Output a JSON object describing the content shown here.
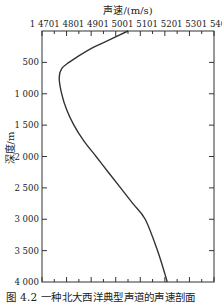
{
  "chart_data": {
    "type": "line",
    "title": "",
    "xlabel": "声速/(m/s)",
    "ylabel": "深度/m",
    "xlim": [
      1470,
      1540
    ],
    "ylim": [
      0,
      4000
    ],
    "y_inverted": true,
    "x_axis_position": "top",
    "x_ticks": [
      1470,
      1480,
      1490,
      1500,
      1510,
      1520,
      1530,
      1540
    ],
    "x_tick_labels": [
      "1 470",
      "1 480",
      "1 490",
      "1 500",
      "1 510",
      "1 520",
      "1 530",
      "1 540"
    ],
    "y_ticks": [
      500,
      1000,
      1500,
      2000,
      2500,
      3000,
      3500,
      4000
    ],
    "y_tick_labels": [
      "500",
      "1 000",
      "1 500",
      "2 000",
      "2 500",
      "3 000",
      "3 500",
      "4 000"
    ],
    "grid": false,
    "legend": null,
    "series": [
      {
        "name": "sound speed profile",
        "x": [
          1505,
          1497,
          1489,
          1481,
          1478,
          1477,
          1478,
          1480,
          1483,
          1487,
          1492,
          1497,
          1502,
          1507,
          1512,
          1517,
          1521
        ],
        "y": [
          0,
          150,
          300,
          500,
          600,
          750,
          1000,
          1250,
          1500,
          1750,
          2000,
          2250,
          2500,
          2750,
          3000,
          3500,
          4000
        ]
      }
    ]
  },
  "figure": {
    "x_title": "声速/(m/s)",
    "y_title": "深度/m",
    "caption": "图 4.2   一种北大西洋典型声道的声速剖面"
  }
}
